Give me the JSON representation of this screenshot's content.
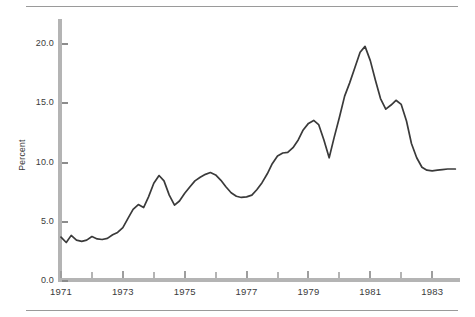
{
  "chart_data": {
    "type": "line",
    "title": "",
    "subtitle": "",
    "xlabel": "",
    "ylabel": "Percent",
    "xlim": [
      1971.0,
      1983.9
    ],
    "ylim": [
      0.0,
      20.0
    ],
    "grid": false,
    "legend": null,
    "y_ticks": [
      "0.0",
      "5.0",
      "10.0",
      "15.0",
      "20.0"
    ],
    "y_tick_values": [
      0.0,
      5.0,
      10.0,
      15.0,
      20.0
    ],
    "x_ticks": [
      "1971",
      "1973",
      "1975",
      "1977",
      "1979",
      "1981",
      "1983"
    ],
    "x_tick_values": [
      1971,
      1973,
      1975,
      1977,
      1979,
      1981,
      1983
    ],
    "x_minor_tick_values": [
      1972,
      1974,
      1976,
      1978,
      1980,
      1982,
      1984
    ],
    "series": [
      {
        "name": "Percent",
        "color": "#3a3a3a",
        "x": [
          1971.0,
          1971.17,
          1971.33,
          1971.5,
          1971.67,
          1971.83,
          1972.0,
          1972.17,
          1972.33,
          1972.5,
          1972.67,
          1972.83,
          1973.0,
          1973.17,
          1973.33,
          1973.5,
          1973.67,
          1973.83,
          1974.0,
          1974.17,
          1974.33,
          1974.5,
          1974.67,
          1974.83,
          1975.0,
          1975.17,
          1975.33,
          1975.5,
          1975.67,
          1975.83,
          1976.0,
          1976.17,
          1976.33,
          1976.5,
          1976.67,
          1976.83,
          1977.0,
          1977.17,
          1977.33,
          1977.5,
          1977.67,
          1977.83,
          1978.0,
          1978.17,
          1978.33,
          1978.5,
          1978.67,
          1978.83,
          1979.0,
          1979.17,
          1979.33,
          1979.5,
          1979.67,
          1979.83,
          1980.0,
          1980.17,
          1980.33,
          1980.5,
          1980.67,
          1980.83,
          1981.0,
          1981.17,
          1981.33,
          1981.5,
          1981.67,
          1981.83,
          1982.0,
          1982.17,
          1982.33,
          1982.5,
          1982.67,
          1982.83,
          1983.0,
          1983.17,
          1983.33,
          1983.5,
          1983.75
        ],
        "y": [
          3.7,
          3.25,
          3.85,
          3.45,
          3.35,
          3.45,
          3.75,
          3.55,
          3.5,
          3.6,
          3.9,
          4.1,
          4.5,
          5.3,
          6.05,
          6.45,
          6.2,
          7.1,
          8.25,
          8.9,
          8.45,
          7.25,
          6.4,
          6.75,
          7.4,
          7.95,
          8.45,
          8.75,
          9.0,
          9.15,
          8.95,
          8.5,
          7.95,
          7.45,
          7.15,
          7.05,
          7.1,
          7.25,
          7.7,
          8.3,
          9.05,
          9.9,
          10.55,
          10.8,
          10.85,
          11.25,
          11.9,
          12.75,
          13.3,
          13.55,
          13.2,
          11.9,
          10.4,
          12.1,
          13.8,
          15.6,
          16.7,
          18.0,
          19.3,
          19.8,
          18.6,
          16.9,
          15.4,
          14.5,
          14.85,
          15.25,
          14.9,
          13.5,
          11.6,
          10.4,
          9.6,
          9.35,
          9.3,
          9.35,
          9.4,
          9.45,
          9.45
        ]
      }
    ]
  },
  "axis": {
    "y_title": "Percent"
  }
}
